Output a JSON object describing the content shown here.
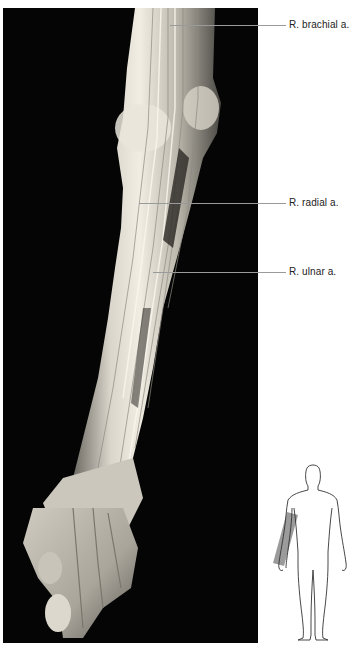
{
  "figure": {
    "kind": "anatomical dissection photograph",
    "background_color": "#050505",
    "tissue_color": "#e8e4da"
  },
  "labels": [
    {
      "id": "brachial",
      "text": "R. brachial a.",
      "y": 25
    },
    {
      "id": "radial",
      "text": "R. radial a.",
      "y": 203
    },
    {
      "id": "ulnar",
      "text": "R. ulnar a.",
      "y": 272
    }
  ],
  "orientation_figure": {
    "kind": "body outline, anterior view",
    "highlight": "right forearm region",
    "highlight_color": "#8a8a8a",
    "outline_color": "#333333"
  },
  "colors": {
    "leader_line": "#9a9a9a",
    "label_text": "#222222",
    "page_background": "#ffffff"
  }
}
